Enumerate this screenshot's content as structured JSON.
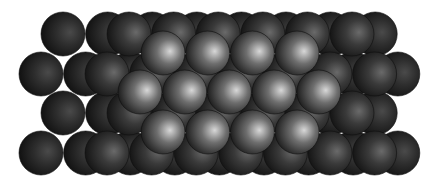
{
  "image": {
    "title": "Close-packed sphere lattice",
    "width": 436,
    "height": 187,
    "background": "#ffffff"
  },
  "layers": [
    {
      "name": "bottom-layer",
      "radius": 22,
      "colors": {
        "highlight": "#4a4a4a",
        "mid": "#2e2e2e",
        "edge": "#111111"
      },
      "rows": [
        {
          "y": 34,
          "x_start": 63,
          "count": 8,
          "spacing": 44.6
        },
        {
          "y": 74,
          "x_start": 41,
          "count": 9,
          "spacing": 44.6
        },
        {
          "y": 113,
          "x_start": 63,
          "count": 8,
          "spacing": 44.6
        },
        {
          "y": 153,
          "x_start": 41,
          "count": 9,
          "spacing": 44.6
        }
      ]
    },
    {
      "name": "middle-layer",
      "radius": 22,
      "colors": {
        "highlight": "#6a6a6a",
        "mid": "#3a3a3a",
        "edge": "#151515"
      },
      "rows": [
        {
          "y": 34,
          "x_start": 129,
          "count": 6,
          "spacing": 44.6
        },
        {
          "y": 74,
          "x_start": 107,
          "count": 7,
          "spacing": 44.6
        },
        {
          "y": 113,
          "x_start": 129,
          "count": 6,
          "spacing": 44.6
        },
        {
          "y": 153,
          "x_start": 107,
          "count": 7,
          "spacing": 44.6
        }
      ]
    },
    {
      "name": "top-layer",
      "radius": 22,
      "colors": {
        "highlight": "#d8d8d8",
        "mid": "#6e6e6e",
        "edge": "#1e1e1e"
      },
      "rows": [
        {
          "y": 53,
          "x_start": 163,
          "count": 4,
          "spacing": 44.7
        },
        {
          "y": 92,
          "x_start": 140,
          "count": 5,
          "spacing": 44.7
        },
        {
          "y": 132,
          "x_start": 163,
          "count": 4,
          "spacing": 44.7
        }
      ]
    }
  ]
}
